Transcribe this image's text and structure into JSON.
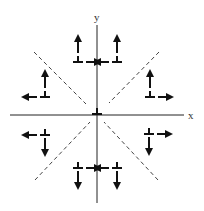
{
  "diagram": {
    "axes": {
      "x_label": "x",
      "y_label": "y"
    },
    "line_color": "#222222",
    "dashed_color": "#444444",
    "symbols": [
      {
        "name": "upper-left-inner",
        "quadrant": "upper",
        "arrows": [
          "up",
          "right"
        ]
      },
      {
        "name": "upper-right-inner",
        "quadrant": "upper",
        "arrows": [
          "up",
          "left"
        ]
      },
      {
        "name": "left-upper",
        "quadrant": "left",
        "arrows": [
          "up",
          "left"
        ]
      },
      {
        "name": "right-upper",
        "quadrant": "right",
        "arrows": [
          "up",
          "right"
        ]
      },
      {
        "name": "origin",
        "quadrant": "center",
        "arrows": []
      },
      {
        "name": "left-lower",
        "quadrant": "left",
        "arrows": [
          "down",
          "left"
        ]
      },
      {
        "name": "right-lower",
        "quadrant": "right",
        "arrows": [
          "down",
          "right"
        ]
      },
      {
        "name": "lower-left-inner",
        "quadrant": "lower",
        "arrows": [
          "down",
          "right"
        ]
      },
      {
        "name": "lower-right-inner",
        "quadrant": "lower",
        "arrows": [
          "down",
          "left"
        ]
      }
    ]
  }
}
